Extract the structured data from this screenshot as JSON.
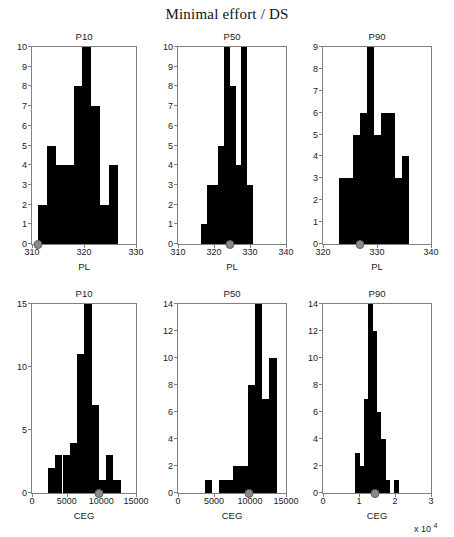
{
  "figure": {
    "title": "Minimal effort / DS",
    "exponent_label": "x 10",
    "exponent_sup": "4"
  },
  "chart_data": [
    {
      "type": "bar",
      "title": "P10",
      "xlabel": "PL",
      "ylabel": "",
      "xlim": [
        310,
        330
      ],
      "ylim": [
        0,
        10
      ],
      "xticks": [
        310,
        320,
        330
      ],
      "xticklabels": [
        "310",
        "320",
        "330"
      ],
      "yticks": [
        0,
        1,
        2,
        3,
        4,
        5,
        6,
        7,
        8,
        9,
        10
      ],
      "yticklabels": [
        "0",
        "1",
        "2",
        "3",
        "4",
        "5",
        "6",
        "7",
        "8",
        "9",
        "10"
      ],
      "bin_edges": [
        311.2,
        312.9,
        314.6,
        316.3,
        318.0,
        319.7,
        321.4,
        323.1,
        324.8,
        326.5
      ],
      "values": [
        2,
        5,
        4,
        4,
        8,
        10,
        7,
        2,
        4
      ],
      "marker_x": 311.2,
      "grid": false
    },
    {
      "type": "bar",
      "title": "P50",
      "xlabel": "PL",
      "ylabel": "",
      "xlim": [
        310,
        340
      ],
      "ylim": [
        0,
        10
      ],
      "xticks": [
        310,
        320,
        330,
        340
      ],
      "xticklabels": [
        "310",
        "320",
        "330",
        "340"
      ],
      "yticks": [
        0,
        1,
        2,
        3,
        4,
        5,
        6,
        7,
        8,
        9,
        10
      ],
      "yticklabels": [
        "0",
        "1",
        "2",
        "3",
        "4",
        "5",
        "6",
        "7",
        "8",
        "9",
        "10"
      ],
      "bin_edges": [
        316.4,
        318.0,
        319.6,
        321.2,
        322.8,
        324.4,
        326.0,
        327.6,
        329.2,
        330.8
      ],
      "values": [
        1,
        3,
        3,
        5,
        10,
        8,
        4,
        10,
        3
      ],
      "marker_x": 324.4,
      "grid": false
    },
    {
      "type": "bar",
      "title": "P90",
      "xlabel": "PL",
      "ylabel": "",
      "xlim": [
        320,
        340
      ],
      "ylim": [
        0,
        9
      ],
      "xticks": [
        320,
        330,
        340
      ],
      "xticklabels": [
        "320",
        "330",
        "340"
      ],
      "yticks": [
        0,
        1,
        2,
        3,
        4,
        5,
        6,
        7,
        8,
        9
      ],
      "yticklabels": [
        "0",
        "1",
        "2",
        "3",
        "4",
        "5",
        "6",
        "7",
        "8",
        "9"
      ],
      "bin_edges": [
        323.0,
        324.3,
        325.6,
        326.9,
        328.2,
        329.5,
        330.8,
        332.1,
        333.4,
        334.7,
        336.0
      ],
      "values": [
        3,
        3,
        5,
        6,
        9,
        5,
        6,
        6,
        3,
        4
      ],
      "marker_x": 326.9,
      "grid": false
    },
    {
      "type": "bar",
      "title": "P10",
      "xlabel": "CEG",
      "ylabel": "",
      "xlim": [
        0,
        15000
      ],
      "ylim": [
        0,
        15
      ],
      "xticks": [
        0,
        5000,
        10000,
        15000
      ],
      "xticklabels": [
        "0",
        "5000",
        "10000",
        "15000"
      ],
      "yticks": [
        0,
        5,
        10,
        15
      ],
      "yticklabels": [
        "0",
        "5",
        "10",
        "15"
      ],
      "bin_edges": [
        2300,
        3350,
        4400,
        5450,
        6500,
        7550,
        8600,
        9650,
        10700,
        11750,
        12800
      ],
      "values": [
        2,
        3,
        3,
        4,
        11,
        15,
        7,
        1,
        3,
        1
      ],
      "marker_x": 9650,
      "grid": false
    },
    {
      "type": "bar",
      "title": "P50",
      "xlabel": "CEG",
      "ylabel": "",
      "xlim": [
        0,
        15000
      ],
      "ylim": [
        0,
        14
      ],
      "xticks": [
        0,
        5000,
        10000,
        15000
      ],
      "xticklabels": [
        "0",
        "5000",
        "10000",
        "15000"
      ],
      "yticks": [
        0,
        2,
        4,
        6,
        8,
        10,
        12,
        14
      ],
      "yticklabels": [
        "0",
        "2",
        "4",
        "6",
        "8",
        "10",
        "12",
        "14"
      ],
      "bin_edges": [
        3700,
        4700,
        5700,
        6700,
        7700,
        8700,
        9700,
        10700,
        11700,
        12700,
        13700
      ],
      "values": [
        1,
        0,
        1,
        1,
        2,
        2,
        8,
        14,
        7,
        10,
        5
      ],
      "marker_x": 9900,
      "grid": false
    },
    {
      "type": "bar",
      "title": "P90",
      "xlabel": "CEG",
      "ylabel": "",
      "xlim": [
        0,
        30000
      ],
      "ylim": [
        0,
        14
      ],
      "xticks": [
        0,
        10000,
        20000,
        30000
      ],
      "xticklabels": [
        "0",
        "1",
        "2",
        "3"
      ],
      "yticks": [
        0,
        2,
        4,
        6,
        8,
        10,
        12,
        14
      ],
      "yticklabels": [
        "0",
        "2",
        "4",
        "6",
        "8",
        "10",
        "12",
        "14"
      ],
      "bin_edges": [
        9000,
        10200,
        11400,
        12600,
        13800,
        15000,
        16200,
        17400,
        18600,
        19800,
        21000
      ],
      "values": [
        3,
        2,
        7,
        14,
        12,
        6,
        4,
        1,
        0,
        1
      ],
      "marker_x": 14400,
      "grid": false
    }
  ]
}
